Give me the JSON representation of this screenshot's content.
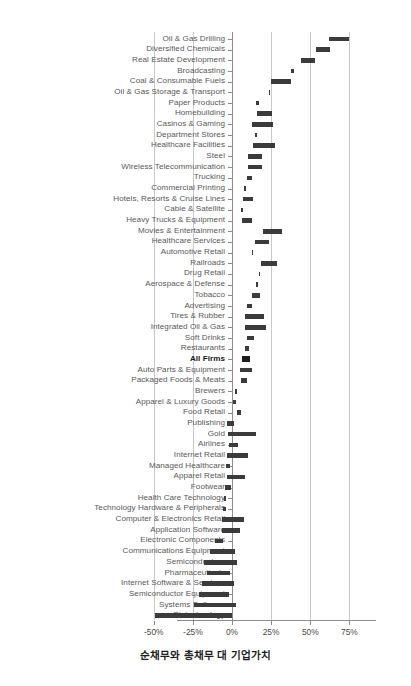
{
  "chart_data": {
    "type": "bar",
    "orientation": "horizontal",
    "title": "",
    "subtitle": "",
    "xlabel": "순채무와 총채무 대 기업가치",
    "ylabel": "",
    "xlim": [
      -57,
      80
    ],
    "xticks": [
      -50,
      -25,
      0,
      25,
      50,
      75
    ],
    "xticklabels": [
      "-50%",
      "-25%",
      "0%",
      "25%",
      "50%",
      "75%"
    ],
    "grid": true,
    "legend": null,
    "highlight_category": "All Firms",
    "bar_color": "#3b3b3b",
    "grid_color": "#c9c9c9",
    "axis_color": "#8c8c8c",
    "categories": [
      "Oil & Gas Drilling",
      "Diversified Chemicals",
      "Real Estate Development",
      "Broadcasting",
      "Coal & Consumable Fuels",
      "Oil & Gas Storage & Transport",
      "Paper Products",
      "Homebuilding",
      "Casinos & Gaming",
      "Department Stores",
      "Healthcare Facilities",
      "Steel",
      "Wireless Telecommunication",
      "Trucking",
      "Commercial Printing",
      "Hotels, Resorts & Cruise Lines",
      "Cable & Satellite",
      "Heavy Trucks & Equipment",
      "Movies & Entertainment",
      "Healthcare Services",
      "Automotive Retail",
      "Railroads",
      "Drug Retail",
      "Aerospace & Defense",
      "Tobacco",
      "Advertising",
      "Tires & Rubber",
      "Integrated Oil & Gas",
      "Soft Drinks",
      "Restaurants",
      "All Firms",
      "Auto Parts & Equipment",
      "Packaged Foods & Meats",
      "Brewers",
      "Apparel & Luxury Goods",
      "Food Retail",
      "Publishing",
      "Gold",
      "Airlines",
      "Internet Retail",
      "Managed Healthcare",
      "Apparel Retail",
      "Footwear",
      "Health Care Technology",
      "Technology Hardware & Peripherals",
      "Computer & Electronics Retail",
      "Application Software",
      "Electronic Components",
      "Communications Equipment",
      "Semiconductors",
      "Pharmaceuticals",
      "Internet Software & Services",
      "Semiconductor Equipment",
      "Systems Software",
      "Biotechnology"
    ],
    "values_start": [
      62,
      54,
      45,
      37,
      30,
      26,
      24,
      22,
      20,
      18,
      16,
      15,
      14,
      12,
      11,
      10,
      9,
      8,
      7,
      6,
      5,
      4,
      3,
      2.5,
      2,
      1.5,
      1,
      0.5,
      0,
      0,
      0,
      0,
      0,
      0,
      -1,
      -1,
      -2,
      -2,
      -3,
      -4,
      -5,
      -6,
      -7,
      -8,
      -9,
      -10,
      -11,
      -13,
      -15,
      -17,
      -19,
      -21,
      -24,
      -31,
      -50
    ],
    "values_end": [
      75,
      66,
      56,
      48,
      40,
      33,
      31,
      30,
      29,
      28,
      26,
      24,
      23,
      22,
      20,
      19,
      18,
      17,
      16,
      15,
      14,
      13,
      12,
      11,
      10,
      9,
      8.5,
      8,
      7,
      6,
      5,
      4,
      3,
      2,
      1.5,
      1,
      0.5,
      0,
      0,
      0,
      0,
      0,
      0,
      0,
      0,
      0,
      0,
      0,
      0,
      0,
      0,
      0,
      0,
      0,
      0
    ],
    "series": [
      {
        "name": "Net Debt to EV / Total Debt to EV range",
        "type": "range_bar"
      }
    ],
    "bars": [
      {
        "category": "Oil & Gas Drilling",
        "start": 62.0,
        "end": 75.0
      },
      {
        "category": "Diversified Chemicals",
        "start": 53.5,
        "end": 62.5
      },
      {
        "category": "Real Estate Development",
        "start": 44.0,
        "end": 53.0
      },
      {
        "category": "Broadcasting",
        "start": 37.5,
        "end": 39.5
      },
      {
        "category": "Coal & Consumable Fuels",
        "start": 25.0,
        "end": 37.5
      },
      {
        "category": "Oil & Gas Storage & Transport",
        "start": 23.5,
        "end": 24.5
      },
      {
        "category": "Paper Products",
        "start": 15.5,
        "end": 17.5
      },
      {
        "category": "Homebuilding",
        "start": 16.0,
        "end": 25.5
      },
      {
        "category": "Casinos & Gaming",
        "start": 13.0,
        "end": 26.0
      },
      {
        "category": "Department Stores",
        "start": 14.5,
        "end": 16.0
      },
      {
        "category": "Healthcare Facilities",
        "start": 13.5,
        "end": 27.5
      },
      {
        "category": "Steel",
        "start": 10.5,
        "end": 19.0
      },
      {
        "category": "Wireless Telecommunication",
        "start": 10.5,
        "end": 19.0
      },
      {
        "category": "Trucking",
        "start": 9.5,
        "end": 13.0
      },
      {
        "category": "Commercial Printing",
        "start": 7.5,
        "end": 9.0
      },
      {
        "category": "Hotels, Resorts & Cruise Lines",
        "start": 7.0,
        "end": 13.5
      },
      {
        "category": "Cable & Satellite",
        "start": 5.5,
        "end": 7.0
      },
      {
        "category": "Heavy Trucks & Equipment",
        "start": 6.5,
        "end": 13.0
      },
      {
        "category": "Movies & Entertainment",
        "start": 20.0,
        "end": 32.0
      },
      {
        "category": "Healthcare Services",
        "start": 14.5,
        "end": 23.5
      },
      {
        "category": "Automotive Retail",
        "start": 12.5,
        "end": 13.5
      },
      {
        "category": "Railroads",
        "start": 18.5,
        "end": 29.0
      },
      {
        "category": "Drug Retail",
        "start": 17.0,
        "end": 18.0
      },
      {
        "category": "Aerospace & Defense",
        "start": 15.5,
        "end": 16.5
      },
      {
        "category": "Tobacco",
        "start": 12.5,
        "end": 18.0
      },
      {
        "category": "Advertising",
        "start": 9.5,
        "end": 13.0
      },
      {
        "category": "Tires & Rubber",
        "start": 8.5,
        "end": 20.5
      },
      {
        "category": "Integrated Oil & Gas",
        "start": 8.0,
        "end": 21.5
      },
      {
        "category": "Soft Drinks",
        "start": 9.5,
        "end": 14.0
      },
      {
        "category": "Restaurants",
        "start": 8.5,
        "end": 11.0
      },
      {
        "category": "All Firms",
        "start": 6.5,
        "end": 11.5
      },
      {
        "category": "Auto Parts & Equipment",
        "start": 5.0,
        "end": 13.0
      },
      {
        "category": "Packaged Foods & Meats",
        "start": 5.5,
        "end": 9.5
      },
      {
        "category": "Brewers",
        "start": 2.0,
        "end": 3.0
      },
      {
        "category": "Apparel & Luxury Goods",
        "start": 0.5,
        "end": 2.5
      },
      {
        "category": "Food Retail",
        "start": 3.0,
        "end": 6.0
      },
      {
        "category": "Publishing",
        "start": -3.0,
        "end": 1.0
      },
      {
        "category": "Gold",
        "start": -2.5,
        "end": 15.5
      },
      {
        "category": "Airlines",
        "start": -2.0,
        "end": 4.0
      },
      {
        "category": "Internet Retail",
        "start": -3.0,
        "end": 10.5
      },
      {
        "category": "Managed Healthcare",
        "start": -4.0,
        "end": -1.0
      },
      {
        "category": "Apparel Retail",
        "start": -3.5,
        "end": 8.0
      },
      {
        "category": "Footwear",
        "start": -4.5,
        "end": -1.0
      },
      {
        "category": "Health Care Technology",
        "start": -5.0,
        "end": -3.5
      },
      {
        "category": "Technology Hardware & Peripherals",
        "start": -5.5,
        "end": -4.0
      },
      {
        "category": "Computer & Electronics Retail",
        "start": -6.5,
        "end": 8.0
      },
      {
        "category": "Application Software",
        "start": -6.5,
        "end": 5.0
      },
      {
        "category": "Electronic Components",
        "start": -11.0,
        "end": -6.0
      },
      {
        "category": "Communications Equipment",
        "start": -14.0,
        "end": 2.0
      },
      {
        "category": "Semiconductors",
        "start": -18.0,
        "end": 3.5
      },
      {
        "category": "Pharmaceuticals",
        "start": -16.0,
        "end": -1.5
      },
      {
        "category": "Internet Software & Services",
        "start": -19.0,
        "end": 1.5
      },
      {
        "category": "Semiconductor Equipment",
        "start": -21.0,
        "end": -2.0
      },
      {
        "category": "Systems Software",
        "start": -24.0,
        "end": 2.5
      },
      {
        "category": "Biotechnology",
        "start": -49.0,
        "end": 0.0
      }
    ]
  }
}
